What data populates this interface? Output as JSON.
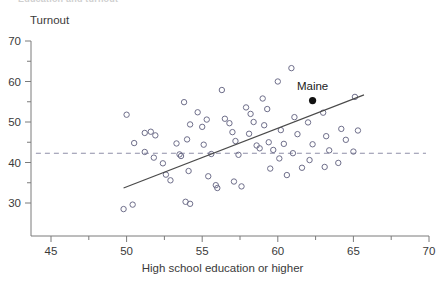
{
  "chart_data": {
    "type": "scatter",
    "title": "Education and turnout",
    "xlabel": "High school education or higher",
    "ylabel": "Turnout",
    "xlim": [
      44.0,
      70.0
    ],
    "ylim": [
      26.5,
      70.0
    ],
    "xticks": [
      45,
      50,
      55,
      60,
      65,
      70
    ],
    "yticks": [
      30,
      40,
      50,
      60,
      70
    ],
    "xminorticks": [
      47.5,
      52.5,
      57.5,
      62.5,
      67.5
    ],
    "yminorticks": [
      35,
      45,
      55,
      65
    ],
    "grid": false,
    "legend": null,
    "marker": "open-circle",
    "series": [
      {
        "name": "States",
        "points": [
          [
            49.8,
            28.5
          ],
          [
            50.4,
            29.6
          ],
          [
            50.0,
            51.8
          ],
          [
            50.5,
            44.8
          ],
          [
            51.2,
            47.3
          ],
          [
            51.6,
            47.6
          ],
          [
            51.9,
            46.7
          ],
          [
            51.2,
            42.6
          ],
          [
            51.8,
            41.2
          ],
          [
            52.4,
            39.8
          ],
          [
            52.6,
            37.0
          ],
          [
            52.9,
            35.6
          ],
          [
            53.3,
            44.7
          ],
          [
            53.5,
            42.0
          ],
          [
            53.6,
            41.6
          ],
          [
            53.8,
            54.9
          ],
          [
            54.2,
            49.4
          ],
          [
            54.0,
            45.7
          ],
          [
            54.1,
            37.9
          ],
          [
            53.9,
            30.3
          ],
          [
            54.2,
            29.8
          ],
          [
            54.7,
            52.4
          ],
          [
            55.0,
            48.8
          ],
          [
            55.3,
            50.6
          ],
          [
            55.1,
            44.4
          ],
          [
            55.6,
            42.1
          ],
          [
            55.4,
            36.6
          ],
          [
            55.9,
            34.4
          ],
          [
            56.0,
            33.7
          ],
          [
            56.3,
            57.9
          ],
          [
            56.5,
            50.8
          ],
          [
            56.8,
            49.7
          ],
          [
            57.0,
            47.5
          ],
          [
            57.2,
            45.3
          ],
          [
            57.4,
            41.9
          ],
          [
            57.1,
            35.3
          ],
          [
            57.6,
            34.1
          ],
          [
            57.9,
            53.6
          ],
          [
            58.2,
            52.0
          ],
          [
            58.4,
            50.0
          ],
          [
            58.1,
            47.1
          ],
          [
            58.6,
            44.2
          ],
          [
            58.8,
            43.5
          ],
          [
            59.0,
            55.8
          ],
          [
            59.3,
            53.2
          ],
          [
            59.1,
            49.2
          ],
          [
            59.4,
            45.0
          ],
          [
            59.7,
            43.1
          ],
          [
            59.5,
            38.5
          ],
          [
            60.0,
            60.0
          ],
          [
            60.2,
            48.0
          ],
          [
            60.4,
            44.6
          ],
          [
            60.1,
            41.0
          ],
          [
            60.6,
            36.9
          ],
          [
            60.9,
            63.3
          ],
          [
            61.1,
            51.2
          ],
          [
            61.3,
            47.0
          ],
          [
            61.0,
            42.3
          ],
          [
            61.6,
            38.7
          ],
          [
            62.0,
            49.9
          ],
          [
            62.3,
            44.5
          ],
          [
            62.1,
            40.6
          ],
          [
            63.0,
            52.3
          ],
          [
            63.2,
            46.5
          ],
          [
            63.4,
            43.0
          ],
          [
            63.1,
            38.9
          ],
          [
            64.2,
            48.3
          ],
          [
            64.5,
            45.6
          ],
          [
            64.0,
            39.9
          ],
          [
            65.1,
            56.2
          ],
          [
            65.3,
            47.9
          ],
          [
            65.0,
            42.7
          ]
        ]
      }
    ],
    "highlight_point": {
      "label": "Maine",
      "x": 62.3,
      "y": 55.3,
      "marker": "filled-circle",
      "label_dx": 0,
      "label_dy": -11
    },
    "fit_line": {
      "name": "regression-line",
      "x0": 49.8,
      "y0": 33.7,
      "x1": 65.7,
      "y1": 56.7,
      "style": "solid"
    },
    "reference_line": {
      "name": "national-average",
      "orientation": "horizontal",
      "y": 42.3,
      "x0": 44.0,
      "x1": 69.8,
      "style": "dashed"
    }
  },
  "colors": {
    "point_stroke": "#6e6e8a",
    "highlight": "#111111",
    "fit_line": "#4a4a4a",
    "reference_line": "#8f8fa8",
    "axis": "#7b7b7b",
    "text": "#3a3a3a",
    "background": "#ffffff"
  }
}
